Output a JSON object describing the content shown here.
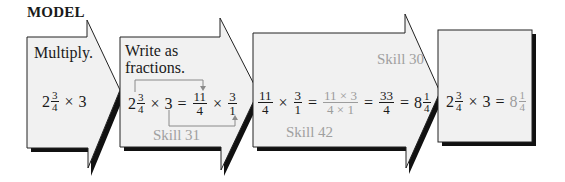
{
  "title": "MODEL",
  "colors": {
    "fill": "#f1f1f1",
    "outline": "#222222",
    "shadow": "#111111",
    "muted_text": "#9c9c9c",
    "bracket": "#8a8a8a"
  },
  "steps": [
    {
      "label": "Multiply.",
      "expression": {
        "whole": "2",
        "num": "3",
        "den": "4",
        "times": "×",
        "factor": "3"
      }
    },
    {
      "label_line1": "Write as",
      "label_line2": "fractions.",
      "expression": {
        "whole": "2",
        "num": "3",
        "den": "4",
        "times": "×",
        "factor": "3",
        "equals": "=",
        "f1_num": "11",
        "f1_den": "4",
        "times2": "×",
        "f2_num": "3",
        "f2_den": "1"
      },
      "skill": "Skill 31"
    },
    {
      "expression": {
        "f1_num": "11",
        "f1_den": "4",
        "times": "×",
        "f2_num": "3",
        "f2_den": "1",
        "eq1": "=",
        "prod_num": "11 × 3",
        "prod_den": "4 × 1",
        "eq2": "=",
        "r_num": "33",
        "r_den": "4",
        "eq3": "=",
        "m_whole": "8",
        "m_num": "1",
        "m_den": "4"
      },
      "skill_top": "Skill 30",
      "skill_bottom": "Skill 42"
    },
    {
      "expression": {
        "whole": "2",
        "num": "3",
        "den": "4",
        "times": "×",
        "factor": "3",
        "equals": "=",
        "a_whole": "8",
        "a_num": "1",
        "a_den": "4"
      }
    }
  ]
}
